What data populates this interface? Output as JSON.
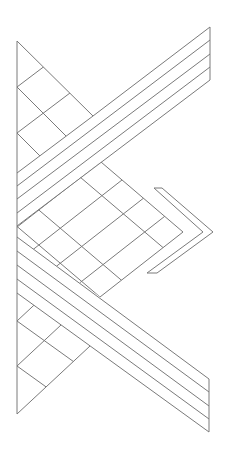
{
  "diagram": {
    "title": "",
    "stroke_color": "#7a7a7a",
    "background_color": "#ffffff",
    "elements": {
      "left_edge": {
        "x": 17,
        "y_top": 41,
        "y_bottom": 414
      },
      "upper_band": {
        "strips": 4,
        "right_x": 210,
        "right_y": [
          27,
          40,
          54,
          67,
          80
        ],
        "left_y": [
          173,
          186,
          199,
          213,
          226
        ]
      },
      "lower_band": {
        "strips": 4,
        "right_x": 209,
        "right_y": [
          379,
          392,
          406,
          419,
          432
        ],
        "left_y": [
          237,
          251,
          265,
          279,
          293
        ]
      },
      "center_diamond": {
        "top": [
          101,
          162
        ],
        "tip": [
          183,
          232
        ],
        "bottom": [
          100,
          297
        ],
        "grid": "4x4 tiles"
      },
      "chevron": {
        "outer": [
          [
            154,
            188
          ],
          [
            213,
            232
          ],
          [
            147,
            273
          ]
        ],
        "inner": [
          [
            162,
            188
          ],
          [
            203,
            232
          ],
          [
            157,
            273
          ]
        ]
      },
      "top_triangle": {
        "vertex": [
          17,
          41
        ],
        "hyp_end": [
          93,
          116
        ]
      },
      "bottom_triangle": {
        "vertex": [
          17,
          414
        ],
        "hyp_end": [
          90,
          346
        ]
      }
    }
  }
}
